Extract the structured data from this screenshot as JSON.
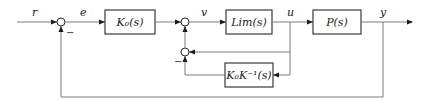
{
  "diagram": {
    "type": "control block diagram",
    "signals": {
      "r": "r",
      "e": "e",
      "v": "v",
      "u": "u",
      "y": "y"
    },
    "blocks": {
      "controller": "K₀(s)",
      "limiter": "Lim(s)",
      "plant": "P(s)",
      "feedback": "K₀K⁻¹(s)"
    },
    "signs": {
      "outer_minus": "−",
      "inner_minus": "−"
    },
    "colors": {
      "wire": "#7a7a7a",
      "block_border": "#3a3a3a",
      "text": "#222222"
    }
  }
}
